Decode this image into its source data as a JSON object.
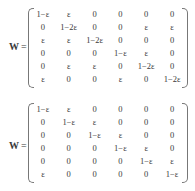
{
  "equations": [
    {
      "lhs": "W",
      "equals": "=",
      "matrix": [
        [
          "1−ε",
          "ε",
          "0",
          "0",
          "0",
          "0"
        ],
        [
          "0",
          "1−2ε",
          "0",
          "0",
          "ε",
          "ε"
        ],
        [
          "ε",
          "ε",
          "1−2ε",
          "0",
          "0",
          "0"
        ],
        [
          "0",
          "0",
          "0",
          "1−ε",
          "ε",
          "0"
        ],
        [
          "0",
          "ε",
          "ε",
          "0",
          "1−2ε",
          "0"
        ],
        [
          "ε",
          "0",
          "0",
          "ε",
          "0",
          "1−2ε"
        ]
      ]
    },
    {
      "lhs": "W",
      "equals": "=",
      "matrix": [
        [
          "1−ε",
          "ε",
          "0",
          "0",
          "0",
          "0"
        ],
        [
          "0",
          "1−ε",
          "ε",
          "0",
          "0",
          "0"
        ],
        [
          "0",
          "0",
          "1−ε",
          "ε",
          "0",
          "0"
        ],
        [
          "0",
          "0",
          "0",
          "1−ε",
          "ε",
          "0"
        ],
        [
          "0",
          "0",
          "0",
          "0",
          "1−ε",
          "ε"
        ],
        [
          "ε",
          "0",
          "0",
          "0",
          "0",
          "1−ε"
        ]
      ]
    }
  ]
}
